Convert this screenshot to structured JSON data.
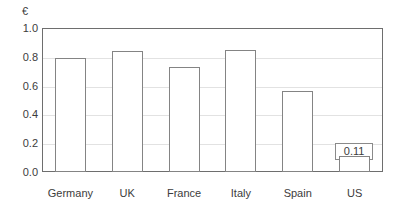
{
  "chart_data": {
    "type": "bar",
    "title": "",
    "subtitle": "",
    "xlabel": "",
    "ylabel": "€",
    "unit_label": "€",
    "categories": [
      "Germany",
      "UK",
      "France",
      "Italy",
      "Spain",
      "US"
    ],
    "values": [
      0.79,
      0.84,
      0.73,
      0.85,
      0.56,
      0.11
    ],
    "data_labels": [
      "0.79",
      "0.84",
      "0.73",
      "0.85",
      "0.56",
      "0.11"
    ],
    "ylim": [
      0.0,
      1.0
    ],
    "ytick_values": [
      1.0,
      0.8,
      0.6,
      0.4,
      0.2,
      0.0
    ],
    "ytick_labels": [
      "1.0",
      "0.8",
      "0.6",
      "0.4",
      "0.2",
      "0.0"
    ],
    "grid": true,
    "grid_orientation": "horizontal",
    "legend": false,
    "legend_position": "none",
    "series": [
      {
        "name": "",
        "values": [
          0.79,
          0.84,
          0.73,
          0.85,
          0.56,
          0.11
        ]
      }
    ],
    "colors": {
      "bar_fill": "#ffffff",
      "bar_border": "#848484",
      "frame": "#6e6e6e",
      "gridline": "#e2e2e2",
      "text": "#3c3c3c",
      "background": "#ffffff"
    }
  }
}
